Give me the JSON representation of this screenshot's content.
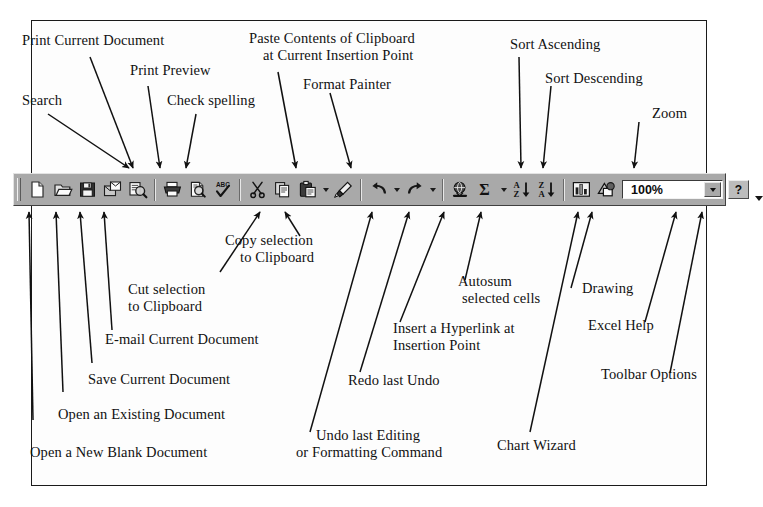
{
  "diagram": {
    "title_alt": "Excel Standard Toolbar annotated diagram"
  },
  "toolbar": {
    "zoom_value": "100%",
    "help_label": "?",
    "buttons": [
      {
        "id": "new",
        "icon": "new-document-icon",
        "tooltip": "Open a New Blank Document"
      },
      {
        "id": "open",
        "icon": "open-folder-icon",
        "tooltip": "Open an Existing Document"
      },
      {
        "id": "save",
        "icon": "floppy-disk-icon",
        "tooltip": "Save Current Document"
      },
      {
        "id": "email",
        "icon": "email-envelope-icon",
        "tooltip": "E-mail Current Document"
      },
      {
        "id": "search",
        "icon": "search-icon",
        "tooltip": "Search"
      },
      {
        "id": "print",
        "icon": "printer-icon",
        "tooltip": "Print Current Document"
      },
      {
        "id": "print-preview",
        "icon": "print-preview-icon",
        "tooltip": "Print Preview"
      },
      {
        "id": "spelling",
        "icon": "spell-check-abc-icon",
        "tooltip": "Check spelling"
      },
      {
        "id": "cut",
        "icon": "scissors-icon",
        "tooltip": "Cut selection to Clipboard"
      },
      {
        "id": "copy",
        "icon": "copy-pages-icon",
        "tooltip": "Copy selection to Clipboard"
      },
      {
        "id": "paste",
        "icon": "clipboard-paste-icon",
        "tooltip": "Paste Contents of Clipboard at Current Insertion Point"
      },
      {
        "id": "format-painter",
        "icon": "paintbrush-icon",
        "tooltip": "Format Painter"
      },
      {
        "id": "undo",
        "icon": "undo-arrow-icon",
        "tooltip": "Undo last Editing or Formatting Command"
      },
      {
        "id": "redo",
        "icon": "redo-arrow-icon",
        "tooltip": "Redo last Undo"
      },
      {
        "id": "hyperlink",
        "icon": "globe-link-icon",
        "tooltip": "Insert a Hyperlink at Insertion Point"
      },
      {
        "id": "autosum",
        "icon": "sigma-icon",
        "tooltip": "Autosum selected cells"
      },
      {
        "id": "sort-asc",
        "icon": "sort-ascending-icon",
        "tooltip": "Sort Ascending"
      },
      {
        "id": "sort-desc",
        "icon": "sort-descending-icon",
        "tooltip": "Sort Descending"
      },
      {
        "id": "chart-wizard",
        "icon": "bar-chart-icon",
        "tooltip": "Chart Wizard"
      },
      {
        "id": "drawing",
        "icon": "drawing-shapes-icon",
        "tooltip": "Drawing"
      },
      {
        "id": "help",
        "icon": "question-mark-icon",
        "tooltip": "Excel Help"
      },
      {
        "id": "toolbar-options",
        "icon": "chevron-down-icon",
        "tooltip": "Toolbar Options"
      }
    ]
  },
  "callouts_top": [
    {
      "id": "print-current-document",
      "text": "Print Current Document"
    },
    {
      "id": "print-preview",
      "text": "Print Preview"
    },
    {
      "id": "search",
      "text": "Search"
    },
    {
      "id": "check-spelling",
      "text": "Check spelling"
    },
    {
      "id": "paste-contents-line1",
      "text": "Paste Contents of Clipboard"
    },
    {
      "id": "paste-contents-line2",
      "text": "at Current Insertion Point"
    },
    {
      "id": "format-painter",
      "text": "Format Painter"
    },
    {
      "id": "sort-ascending",
      "text": "Sort Ascending"
    },
    {
      "id": "sort-descending",
      "text": "Sort Descending"
    },
    {
      "id": "zoom",
      "text": "Zoom"
    }
  ],
  "callouts_bottom": [
    {
      "id": "copy-selection-line1",
      "text": "Copy selection"
    },
    {
      "id": "copy-selection-line2",
      "text": "to Clipboard"
    },
    {
      "id": "cut-selection-line1",
      "text": "Cut selection"
    },
    {
      "id": "cut-selection-line2",
      "text": "to Clipboard"
    },
    {
      "id": "email-current-document",
      "text": "E-mail Current Document"
    },
    {
      "id": "save-current-document",
      "text": "Save Current Document"
    },
    {
      "id": "open-existing-document",
      "text": "Open an Existing Document"
    },
    {
      "id": "open-new-blank-document",
      "text": "Open a New Blank Document"
    },
    {
      "id": "autosum-line1",
      "text": "Autosum"
    },
    {
      "id": "autosum-line2",
      "text": "selected cells"
    },
    {
      "id": "hyperlink-line1",
      "text": "Insert a Hyperlink at"
    },
    {
      "id": "hyperlink-line2",
      "text": "Insertion Point"
    },
    {
      "id": "redo-last-undo",
      "text": "Redo last Undo"
    },
    {
      "id": "undo-line1",
      "text": "Undo last Editing"
    },
    {
      "id": "undo-line2",
      "text": "or Formatting Command"
    },
    {
      "id": "chart-wizard",
      "text": "Chart Wizard"
    },
    {
      "id": "drawing",
      "text": "Drawing"
    },
    {
      "id": "excel-help",
      "text": "Excel Help"
    },
    {
      "id": "toolbar-options",
      "text": "Toolbar Options"
    }
  ]
}
